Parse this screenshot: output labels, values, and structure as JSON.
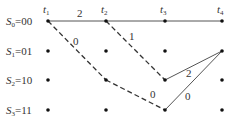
{
  "diagram": {
    "type": "trellis",
    "states": [
      {
        "sym": "S",
        "sub": "0",
        "value": "00"
      },
      {
        "sym": "S",
        "sub": "1",
        "value": "01"
      },
      {
        "sym": "S",
        "sub": "2",
        "value": "10"
      },
      {
        "sym": "S",
        "sub": "3",
        "value": "11"
      }
    ],
    "times": [
      {
        "sym": "t",
        "sub": "1"
      },
      {
        "sym": "t",
        "sub": "2"
      },
      {
        "sym": "t",
        "sub": "3"
      },
      {
        "sym": "t",
        "sub": "4"
      }
    ],
    "edges": [
      {
        "from": [
          0,
          0
        ],
        "to": [
          1,
          0
        ],
        "style": "solid",
        "label": "2"
      },
      {
        "from": [
          1,
          0
        ],
        "to": [
          2,
          0
        ],
        "style": "solid",
        "label": ""
      },
      {
        "from": [
          2,
          0
        ],
        "to": [
          3,
          0
        ],
        "style": "solid",
        "label": ""
      },
      {
        "from": [
          0,
          0
        ],
        "to": [
          1,
          2
        ],
        "style": "dashed",
        "label": "0"
      },
      {
        "from": [
          1,
          0
        ],
        "to": [
          2,
          2
        ],
        "style": "dashed",
        "label": "1"
      },
      {
        "from": [
          1,
          2
        ],
        "to": [
          2,
          3
        ],
        "style": "dashed",
        "label": "0"
      },
      {
        "from": [
          2,
          2
        ],
        "to": [
          3,
          1
        ],
        "style": "solid",
        "label": "2"
      },
      {
        "from": [
          2,
          3
        ],
        "to": [
          3,
          1
        ],
        "style": "solid",
        "label": "0"
      }
    ]
  }
}
